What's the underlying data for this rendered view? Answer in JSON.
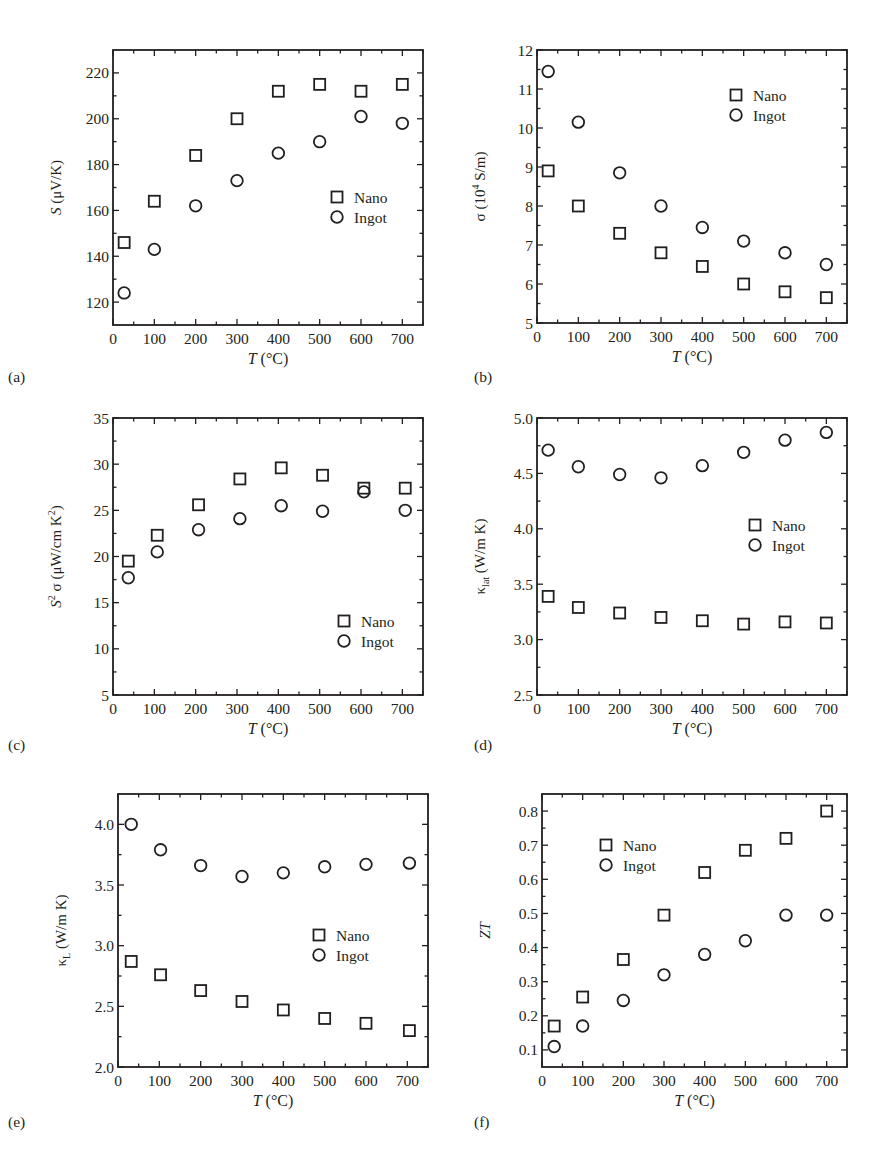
{
  "chart_data": [
    {
      "id": "a",
      "panel_label": "(a)",
      "type": "scatter",
      "title": "",
      "xlabel": "T (°C)",
      "ylabel": "S (μV/K)",
      "xlim": [
        0,
        750
      ],
      "ylim": [
        110,
        230
      ],
      "xticks": [
        0,
        100,
        200,
        300,
        400,
        500,
        600,
        700
      ],
      "yticks": [
        120,
        140,
        160,
        180,
        200,
        220
      ],
      "ytick_labels": [
        "120",
        "140",
        "160",
        "180",
        "200",
        "220"
      ],
      "grid": false,
      "legend_position": "lower right",
      "legend": [
        {
          "name": "Nano",
          "marker": "square"
        },
        {
          "name": "Ingot",
          "marker": "circle"
        }
      ],
      "series": [
        {
          "name": "Nano",
          "marker": "square",
          "x": [
            27,
            100,
            200,
            300,
            400,
            500,
            600,
            700
          ],
          "y": [
            146,
            164,
            184,
            200,
            212,
            215,
            212,
            215
          ]
        },
        {
          "name": "Ingot",
          "marker": "circle",
          "x": [
            27,
            100,
            200,
            300,
            400,
            500,
            600,
            700
          ],
          "y": [
            124,
            143,
            162,
            173,
            185,
            190,
            201,
            198
          ]
        }
      ]
    },
    {
      "id": "b",
      "panel_label": "(b)",
      "type": "scatter",
      "title": "",
      "xlabel": "T (°C)",
      "ylabel": "σ (10⁴ S/m)",
      "xlim": [
        0,
        750
      ],
      "ylim": [
        5,
        12
      ],
      "xticks": [
        0,
        100,
        200,
        300,
        400,
        500,
        600,
        700
      ],
      "yticks": [
        5,
        6,
        7,
        8,
        9,
        10,
        11,
        12
      ],
      "ytick_labels": [
        "5",
        "6",
        "7",
        "8",
        "9",
        "10",
        "11",
        "12"
      ],
      "grid": false,
      "legend_position": "upper right",
      "legend": [
        {
          "name": "Nano",
          "marker": "square"
        },
        {
          "name": "Ingot",
          "marker": "circle"
        }
      ],
      "series": [
        {
          "name": "Nano",
          "marker": "square",
          "x": [
            27,
            100,
            200,
            300,
            400,
            500,
            600,
            700
          ],
          "y": [
            8.9,
            8.0,
            7.3,
            6.8,
            6.45,
            6.0,
            5.8,
            5.65
          ]
        },
        {
          "name": "Ingot",
          "marker": "circle",
          "x": [
            27,
            100,
            200,
            300,
            400,
            500,
            600,
            700
          ],
          "y": [
            11.45,
            10.15,
            8.85,
            8.0,
            7.45,
            7.1,
            6.8,
            6.5
          ]
        }
      ]
    },
    {
      "id": "c",
      "panel_label": "(c)",
      "type": "scatter",
      "title": "",
      "xlabel": "T (°C)",
      "ylabel": "S² σ (μW/cm K²)",
      "xlim": [
        0,
        750
      ],
      "ylim": [
        5,
        35
      ],
      "xticks": [
        0,
        100,
        200,
        300,
        400,
        500,
        600,
        700
      ],
      "yticks": [
        5,
        10,
        15,
        20,
        25,
        30,
        35
      ],
      "ytick_labels": [
        "5",
        "10",
        "15",
        "20",
        "25",
        "30",
        "35"
      ],
      "grid": false,
      "legend_position": "lower right",
      "legend": [
        {
          "name": "Nano",
          "marker": "square"
        },
        {
          "name": "Ingot",
          "marker": "circle"
        }
      ],
      "series": [
        {
          "name": "Nano",
          "marker": "square",
          "x": [
            37,
            107,
            207,
            307,
            407,
            507,
            607,
            707
          ],
          "y": [
            19.5,
            22.3,
            25.6,
            28.4,
            29.6,
            28.8,
            27.4,
            27.4
          ]
        },
        {
          "name": "Ingot",
          "marker": "circle",
          "x": [
            37,
            107,
            207,
            307,
            407,
            507,
            607,
            707
          ],
          "y": [
            17.7,
            20.5,
            22.9,
            24.1,
            25.5,
            24.9,
            27.0,
            25.0
          ]
        }
      ]
    },
    {
      "id": "d",
      "panel_label": "(d)",
      "type": "scatter",
      "title": "",
      "xlabel": "T (°C)",
      "ylabel": "κlat (W/m K)",
      "xlim": [
        0,
        750
      ],
      "ylim": [
        2.5,
        5.0
      ],
      "xticks": [
        0,
        100,
        200,
        300,
        400,
        500,
        600,
        700
      ],
      "yticks": [
        2.5,
        3.0,
        3.5,
        4.0,
        4.5,
        5.0
      ],
      "ytick_labels": [
        "2.5",
        "3.0",
        "3.5",
        "4.0",
        "4.5",
        "5.0"
      ],
      "grid": false,
      "legend_position": "center right",
      "legend": [
        {
          "name": "Nano",
          "marker": "square"
        },
        {
          "name": "Ingot",
          "marker": "circle"
        }
      ],
      "series": [
        {
          "name": "Nano",
          "marker": "square",
          "x": [
            27,
            100,
            200,
            300,
            400,
            500,
            600,
            700
          ],
          "y": [
            3.39,
            3.29,
            3.24,
            3.2,
            3.17,
            3.14,
            3.16,
            3.15
          ]
        },
        {
          "name": "Ingot",
          "marker": "circle",
          "x": [
            27,
            100,
            200,
            300,
            400,
            500,
            600,
            700
          ],
          "y": [
            4.71,
            4.56,
            4.49,
            4.46,
            4.57,
            4.69,
            4.8,
            4.87
          ]
        }
      ]
    },
    {
      "id": "e",
      "panel_label": "(e)",
      "type": "scatter",
      "title": "",
      "xlabel": "T (°C)",
      "ylabel": "κL (W/m K)",
      "xlim": [
        0,
        750
      ],
      "ylim": [
        2.0,
        4.25
      ],
      "xticks": [
        0,
        100,
        200,
        300,
        400,
        500,
        600,
        700
      ],
      "yticks": [
        2.0,
        2.5,
        3.0,
        3.5,
        4.0
      ],
      "ytick_labels": [
        "2.0",
        "2.5",
        "3.0",
        "3.5",
        "4.0"
      ],
      "grid": false,
      "legend_position": "center right",
      "legend": [
        {
          "name": "Nano",
          "marker": "square"
        },
        {
          "name": "Ingot",
          "marker": "circle"
        }
      ],
      "series": [
        {
          "name": "Nano",
          "marker": "square",
          "x": [
            32,
            103,
            200,
            300,
            400,
            500,
            600,
            705
          ],
          "y": [
            2.87,
            2.76,
            2.63,
            2.54,
            2.47,
            2.4,
            2.36,
            2.3
          ]
        },
        {
          "name": "Ingot",
          "marker": "circle",
          "x": [
            32,
            103,
            200,
            300,
            400,
            500,
            600,
            705
          ],
          "y": [
            4.0,
            3.79,
            3.66,
            3.57,
            3.6,
            3.65,
            3.67,
            3.68
          ]
        }
      ]
    },
    {
      "id": "f",
      "panel_label": "(f)",
      "type": "scatter",
      "title": "",
      "xlabel": "T (°C)",
      "ylabel": "ZT",
      "xlim": [
        0,
        750
      ],
      "ylim": [
        0.05,
        0.85
      ],
      "xticks": [
        0,
        100,
        200,
        300,
        400,
        500,
        600,
        700
      ],
      "yticks": [
        0.1,
        0.2,
        0.3,
        0.4,
        0.5,
        0.6,
        0.7,
        0.8
      ],
      "ytick_labels": [
        "0.1",
        "0.2",
        "0.3",
        "0.4",
        "0.5",
        "0.6",
        "0.7",
        "0.8"
      ],
      "grid": false,
      "legend_position": "upper left",
      "legend": [
        {
          "name": "Nano",
          "marker": "square"
        },
        {
          "name": "Ingot",
          "marker": "circle"
        }
      ],
      "series": [
        {
          "name": "Nano",
          "marker": "square",
          "x": [
            30,
            100,
            200,
            300,
            400,
            500,
            600,
            700
          ],
          "y": [
            0.17,
            0.255,
            0.365,
            0.495,
            0.62,
            0.685,
            0.72,
            0.8
          ]
        },
        {
          "name": "Ingot",
          "marker": "circle",
          "x": [
            30,
            100,
            200,
            300,
            400,
            500,
            600,
            700
          ],
          "y": [
            0.11,
            0.17,
            0.245,
            0.32,
            0.38,
            0.42,
            0.495,
            0.495
          ]
        }
      ]
    }
  ],
  "layout": {
    "panels": [
      {
        "id": "a",
        "frame": [
          113,
          50,
          423,
          325
        ],
        "legend_xy": [
          337,
          197
        ],
        "label_xy": [
          8,
          382
        ]
      },
      {
        "id": "b",
        "frame": [
          537,
          50,
          847,
          323
        ],
        "legend_xy": [
          736,
          95
        ],
        "label_xy": [
          474,
          382
        ]
      },
      {
        "id": "c",
        "frame": [
          113,
          418,
          423,
          695
        ],
        "legend_xy": [
          344,
          621
        ],
        "label_xy": [
          8,
          750
        ]
      },
      {
        "id": "d",
        "frame": [
          537,
          418,
          847,
          695
        ],
        "legend_xy": [
          755,
          525
        ],
        "label_xy": [
          474,
          750
        ]
      },
      {
        "id": "e",
        "frame": [
          118,
          794,
          428,
          1067
        ],
        "legend_xy": [
          319,
          935
        ],
        "label_xy": [
          8,
          1127
        ]
      },
      {
        "id": "f",
        "frame": [
          542,
          794,
          847,
          1067
        ],
        "legend_xy": [
          606,
          845
        ],
        "label_xy": [
          474,
          1127
        ]
      }
    ]
  }
}
